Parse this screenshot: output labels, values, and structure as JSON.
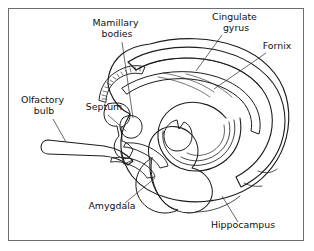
{
  "figure": {
    "kind": "anatomical-line-drawing",
    "background_color": "#ffffff",
    "frame_color": "#6e6e70",
    "ink_color": "#1c1c1e",
    "fill_light": "#e3e3e3",
    "fill_mid": "#d4d4d4",
    "fill_dark": "#bdbdbd"
  },
  "labels": [
    {
      "id": "mamillary-bodies",
      "text_line1": "Mamillary",
      "text_line2": "bodies",
      "x": 117,
      "y": 26,
      "line_height": 11
    },
    {
      "id": "cingulate-gyrus",
      "text_line1": "Cingulate",
      "text_line2": "gyrus",
      "x": 236,
      "y": 20,
      "line_height": 11
    },
    {
      "id": "fornix",
      "text_line1": "Fornix",
      "text_line2": "",
      "x": 277,
      "y": 49,
      "line_height": 11
    },
    {
      "id": "olfactory-bulb",
      "text_line1": "Olfactory",
      "text_line2": "bulb",
      "x": 44,
      "y": 103,
      "line_height": 11
    },
    {
      "id": "septum",
      "text_line1": "Septum",
      "text_line2": "",
      "x": 104,
      "y": 110,
      "line_height": 11
    },
    {
      "id": "amygdala",
      "text_line1": "Amygdala",
      "text_line2": "",
      "x": 112,
      "y": 209,
      "line_height": 11
    },
    {
      "id": "hippocampus",
      "text_line1": "Hippocampus",
      "text_line2": "",
      "x": 243,
      "y": 228,
      "line_height": 11
    }
  ],
  "structures": [
    {
      "id": "cerebral-outline",
      "name": "Cerebral hemisphere outline"
    },
    {
      "id": "cingulate-gyrus-band",
      "name": "Cingulate gyrus band"
    },
    {
      "id": "fornix-body",
      "name": "Fornix"
    },
    {
      "id": "hippocampus-spiral",
      "name": "Hippocampus"
    },
    {
      "id": "amygdala-body",
      "name": "Amygdala"
    },
    {
      "id": "olfactory-bulb-tract",
      "name": "Olfactory bulb and tract"
    },
    {
      "id": "septum-region",
      "name": "Septum"
    },
    {
      "id": "mamillary-body",
      "name": "Mamillary bodies"
    },
    {
      "id": "dentate-serrations",
      "name": "Dentate gyrus serrations"
    }
  ]
}
